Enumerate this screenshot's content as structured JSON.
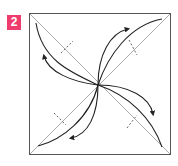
{
  "step": {
    "number": "2",
    "badge_color": "#ef3c6e"
  },
  "diagram": {
    "paper": {
      "x": 29,
      "y": 13,
      "width": 142,
      "height": 142,
      "stroke": "#555555"
    },
    "diagonal_color": "#999999",
    "curve_color": "#222222",
    "arrows": [
      {
        "name": "arrow-top-left",
        "direction": "down-left"
      },
      {
        "name": "arrow-top-right",
        "direction": "up-right"
      },
      {
        "name": "arrow-bottom-right",
        "direction": "down-right"
      },
      {
        "name": "arrow-bottom-left",
        "direction": "down-left"
      }
    ],
    "valley_fold_marks": 4
  }
}
